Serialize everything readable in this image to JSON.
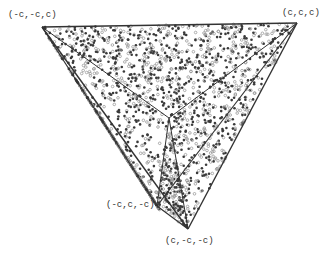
{
  "figure": {
    "type": "tetrahedron-projection-scatter",
    "vertices": [
      {
        "label": "(-c,-c,c)",
        "x": 42,
        "y": 27,
        "lx": 8,
        "ly": 10
      },
      {
        "label": "(c,c,c)",
        "x": 297,
        "y": 23,
        "lx": 282,
        "ly": 8
      },
      {
        "label": "(-c,c,-c)",
        "x": 157,
        "y": 206,
        "lx": 106,
        "ly": 200
      },
      {
        "label": "(c,-c,-c)",
        "x": 188,
        "y": 229,
        "lx": 165,
        "ly": 236
      }
    ],
    "center": {
      "x": 169,
      "y": 118
    },
    "colors": {
      "line": "#333333",
      "dot_dark": "#3a3a3a",
      "dot_light": "#9a9a9a",
      "background": "#ffffff"
    }
  }
}
